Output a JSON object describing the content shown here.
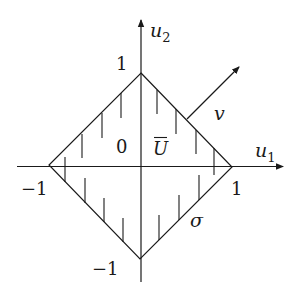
{
  "diagram": {
    "axes": {
      "horizontal_label": "u",
      "horizontal_sub": "1",
      "vertical_label": "u",
      "vertical_sub": "2"
    },
    "ticks": {
      "top": "1",
      "right": "1",
      "left": "−1",
      "bottom": "−1",
      "origin": "0"
    },
    "labels": {
      "region": "U",
      "vector": "v",
      "boundary": "σ"
    },
    "colors": {
      "stroke": "#1a1a1a",
      "background": "#ffffff"
    }
  }
}
